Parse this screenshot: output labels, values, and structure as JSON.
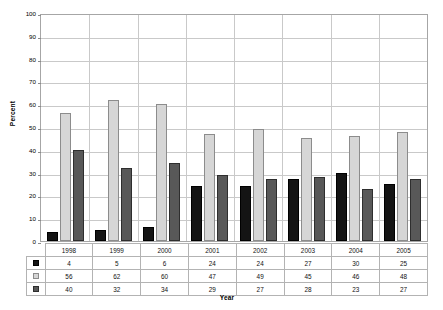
{
  "chart_data": {
    "type": "bar",
    "title": "",
    "xlabel": "Year",
    "ylabel": "Percent",
    "ylim": [
      0,
      100
    ],
    "ytick_step": 10,
    "yticks": [
      100,
      90,
      80,
      70,
      60,
      50,
      40,
      30,
      20,
      10,
      0
    ],
    "grid": true,
    "legend_position": "table-row-labels",
    "categories": [
      "1998",
      "1999",
      "2000",
      "2001",
      "2002",
      "2003",
      "2004",
      "2005"
    ],
    "series": [
      {
        "name": "series-1",
        "swatch": "s0",
        "color": "#141414",
        "values": [
          4,
          5,
          6,
          24,
          24,
          27,
          30,
          25
        ]
      },
      {
        "name": "series-2",
        "swatch": "s1",
        "color": "#d6d6d6",
        "values": [
          56,
          62,
          60,
          47,
          49,
          45,
          46,
          48
        ]
      },
      {
        "name": "series-3",
        "swatch": "s2",
        "color": "#585858",
        "values": [
          40,
          32,
          34,
          29,
          27,
          28,
          23,
          27
        ]
      }
    ]
  },
  "axes": {
    "y_title": "Percent",
    "x_title": "Year"
  },
  "colors": {
    "series_1": "#141414",
    "series_2": "#d6d6d6",
    "series_3": "#585858",
    "gridline": "#c9c9c9",
    "plot_border": "#a6a6a6",
    "table_border": "#b3b3b3",
    "background": "#ffffff"
  }
}
